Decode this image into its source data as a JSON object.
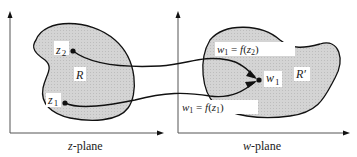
{
  "diagram": {
    "type": "conformal-mapping",
    "colors": {
      "region_fill": "#cfcfcf",
      "stroke": "#111111",
      "axis": "#555555",
      "background": "#ffffff"
    },
    "left_plane": {
      "caption_var": "z",
      "caption_rest": "-plane",
      "region_label": "R",
      "points": [
        {
          "name": "z",
          "sub": "2"
        },
        {
          "name": "z",
          "sub": "1"
        }
      ]
    },
    "right_plane": {
      "caption_var": "w",
      "caption_rest": "-plane",
      "region_label": "R′",
      "point": {
        "name": "w",
        "sub": "1"
      },
      "mapping_labels": [
        {
          "lhs": "w",
          "lhs_sub": "1",
          "eq": " = ",
          "fn": "f",
          "arg": "z",
          "arg_sub": "2"
        },
        {
          "lhs": "w",
          "lhs_sub": "1",
          "eq": " = ",
          "fn": "f",
          "arg": "z",
          "arg_sub": "1"
        }
      ]
    }
  }
}
